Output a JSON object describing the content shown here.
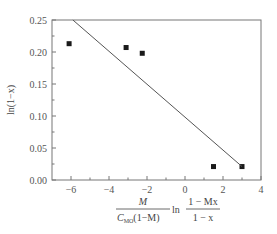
{
  "chart_data": {
    "type": "scatter",
    "title": "",
    "xlabel": "M / (C_MO (1 − M)) · ln((1 − Mx) / (1 − x))",
    "xlabel_parts": {
      "numerator": "M",
      "denominator_c": "C",
      "denominator_sub": "MO",
      "denominator_rest": "(1−M)",
      "ln": "ln",
      "frac_num": "1 − Mx",
      "frac_den": "1 − x"
    },
    "ylabel": "ln(1−x)",
    "xlim": [
      -7,
      4
    ],
    "ylim": [
      0.0,
      0.25
    ],
    "xticks": [
      -6,
      -4,
      -2,
      0,
      2,
      4
    ],
    "xtick_labels": [
      "−6",
      "−4",
      "−2",
      "0",
      "2",
      "4"
    ],
    "yticks": [
      0.0,
      0.05,
      0.1,
      0.15,
      0.2,
      0.25
    ],
    "ytick_labels": [
      "0.00",
      "0.05",
      "0.10",
      "0.15",
      "0.20",
      "0.25"
    ],
    "grid": false,
    "legend": null,
    "series": [
      {
        "name": "data",
        "style": "square-marker",
        "color": "#1a1a1a",
        "x": [
          -6.1,
          -3.1,
          -2.25,
          1.5,
          3.0
        ],
        "y": [
          0.213,
          0.207,
          0.198,
          0.021,
          0.021
        ]
      },
      {
        "name": "fit",
        "style": "line",
        "color": "#555555",
        "x": [
          -5.9,
          3.0
        ],
        "y": [
          0.25,
          0.021
        ]
      }
    ]
  }
}
